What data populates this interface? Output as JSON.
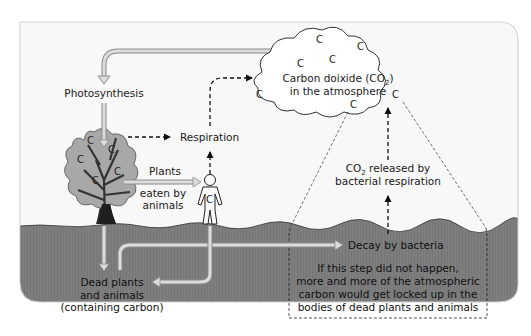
{
  "labels": {
    "photosynthesis": "Photosynthesis",
    "respiration": "Respiration",
    "plants": "Plants",
    "eaten_by": "eaten by",
    "animals": "animals",
    "atmosphere_line1_pre": "Carbon doixide (CO",
    "atmosphere_line1_sub": "2",
    "atmosphere_line1_post": ")",
    "atmosphere_line2": "in the atmosphere",
    "co2_released_pre": "CO",
    "co2_released_sub": "2",
    "co2_released_post": " released by",
    "bacterial_respiration": "bacterial respiration",
    "decay": "Decay by bacteria",
    "dead_line1": "Dead plants",
    "dead_line2": "and animals",
    "dead_line3": "(containing carbon)",
    "note_line1": "If this step did not happen,",
    "note_line2": "more and more of the atmospheric",
    "note_line3": "carbon would get locked up in the",
    "note_line4": "bodies of dead plants and animals"
  },
  "carbon_symbol": "C",
  "icons": {
    "tree": "tree-icon",
    "person": "person-icon",
    "cloud": "cloud-icon"
  },
  "colors": {
    "sky": "#f7f7f7",
    "ground": "#7f7f7f",
    "solid_arrow_fill": "#d9d9d9",
    "solid_arrow_stroke": "#8a8a8a",
    "dashed_arrow": "#111111",
    "tree_foliage": "#a9a9a9",
    "tree_trunk": "#3a3a3a"
  }
}
